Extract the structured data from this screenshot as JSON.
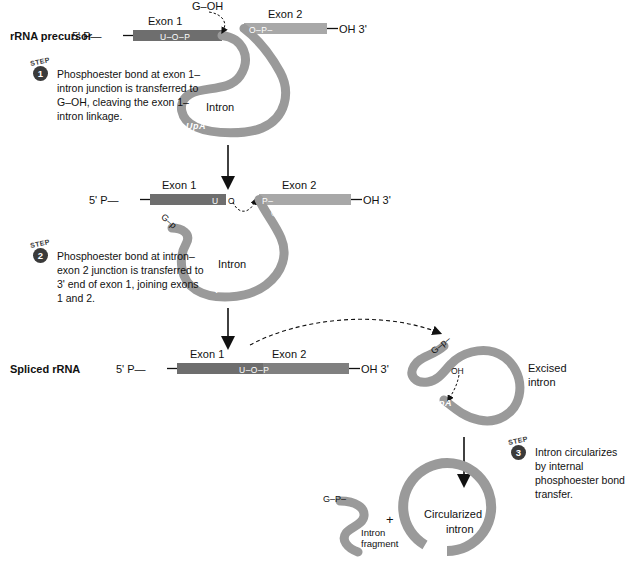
{
  "diagram": {
    "title_row1": "rRNA precursor",
    "title_row3": "Spliced rRNA",
    "colors": {
      "exon1": "#6e6e6e",
      "exon2": "#a8a8a8",
      "intron": "#9a9a9a",
      "badge": "#3a3a3a",
      "background": "#ffffff",
      "text": "#111111"
    }
  },
  "stage1": {
    "label": "rRNA precursor",
    "five_prime": "5' P—",
    "three_prime": "OH 3'",
    "exon1_title": "Exon 1",
    "exon2_title": "Exon 2",
    "exon1_inner": "U–O–P",
    "exon2_inner": "O–P–",
    "g_oh": "G–OH",
    "intron_label": "Intron",
    "upa": "UpA"
  },
  "stage2": {
    "five_prime": "5' P—",
    "three_prime": "OH 3'",
    "exon1_title": "Exon 1",
    "exon2_title": "Exon 2",
    "exon1_u": "U",
    "exon1_o": "O",
    "exon2_p": "P–",
    "intron_o": "O",
    "g_p": "G–p",
    "intron_label": "Intron",
    "upa": "UpA"
  },
  "stage3": {
    "label": "Spliced rRNA",
    "five_prime": "5' P—",
    "three_prime": "OH 3'",
    "exon1_title": "Exon 1",
    "exon2_title": "Exon 2",
    "junction": "U–O–P",
    "excised_line1": "Excised",
    "excised_line2": "intron",
    "excised_gp": "G–p–",
    "excised_oh": "OH",
    "excised_upa": "UpA"
  },
  "stage4": {
    "fragment_gp": "G–P–",
    "fragment_line1": "Intron",
    "fragment_line2": "fragment",
    "plus": "+",
    "circle_line1": "Circularized",
    "circle_line2": "intron",
    "opa": "OpA"
  },
  "steps": [
    {
      "word": "STEP",
      "number": "1",
      "text": "Phosphoester bond at exon 1–intron junction is transferred to G–OH, cleaving the exon 1–intron linkage."
    },
    {
      "word": "STEP",
      "number": "2",
      "text": "Phosphoester bond at intron–exon 2 junction is transferred to 3' end of exon 1, joining exons 1 and 2."
    },
    {
      "word": "STEP",
      "number": "3",
      "text": "Intron circularizes by internal phosphoester bond transfer."
    }
  ]
}
